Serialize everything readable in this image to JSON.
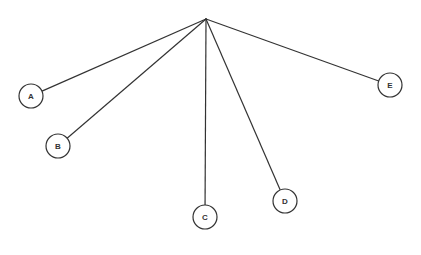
{
  "diagram": {
    "type": "tree",
    "root": {
      "x": 206,
      "y": 19
    },
    "node_radius": 12,
    "stroke_color": "#333333",
    "background": "#ffffff",
    "nodes": [
      {
        "id": "A",
        "label": "A",
        "x": 31,
        "y": 96
      },
      {
        "id": "B",
        "label": "B",
        "x": 58,
        "y": 146
      },
      {
        "id": "C",
        "label": "C",
        "x": 205,
        "y": 217
      },
      {
        "id": "D",
        "label": "D",
        "x": 285,
        "y": 201
      },
      {
        "id": "E",
        "label": "E",
        "x": 390,
        "y": 85
      }
    ]
  }
}
